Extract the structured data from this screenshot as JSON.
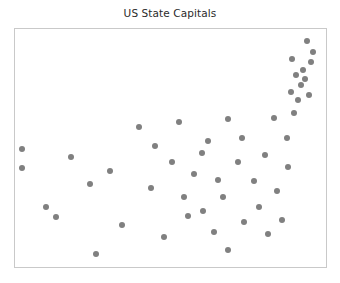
{
  "figure": {
    "title": "US State Capitals",
    "background_color": "#ffffff",
    "border_color": "#c9c9c9",
    "title_color": "#2b2b2b"
  },
  "chart_data": {
    "type": "scatter",
    "title": "US State Capitals",
    "xlabel": "",
    "ylabel": "",
    "xlim": [
      0,
      1
    ],
    "ylim": [
      0,
      1
    ],
    "grid": false,
    "legend": null,
    "marker": {
      "shape": "circle",
      "color": "#808080",
      "size_px": 6
    },
    "series": [
      {
        "name": "US State Capitals",
        "color": "#808080",
        "points": [
          {
            "x": 0.022,
            "y": 0.494
          },
          {
            "x": 0.022,
            "y": 0.415
          },
          {
            "x": 0.099,
            "y": 0.252
          },
          {
            "x": 0.131,
            "y": 0.21
          },
          {
            "x": 0.179,
            "y": 0.461
          },
          {
            "x": 0.24,
            "y": 0.348
          },
          {
            "x": 0.262,
            "y": 0.056
          },
          {
            "x": 0.307,
            "y": 0.405
          },
          {
            "x": 0.345,
            "y": 0.178
          },
          {
            "x": 0.399,
            "y": 0.588
          },
          {
            "x": 0.438,
            "y": 0.334
          },
          {
            "x": 0.45,
            "y": 0.507
          },
          {
            "x": 0.479,
            "y": 0.127
          },
          {
            "x": 0.505,
            "y": 0.443
          },
          {
            "x": 0.527,
            "y": 0.61
          },
          {
            "x": 0.543,
            "y": 0.295
          },
          {
            "x": 0.556,
            "y": 0.215
          },
          {
            "x": 0.575,
            "y": 0.392
          },
          {
            "x": 0.601,
            "y": 0.48
          },
          {
            "x": 0.604,
            "y": 0.237
          },
          {
            "x": 0.62,
            "y": 0.528
          },
          {
            "x": 0.639,
            "y": 0.145
          },
          {
            "x": 0.652,
            "y": 0.366
          },
          {
            "x": 0.668,
            "y": 0.293
          },
          {
            "x": 0.684,
            "y": 0.623
          },
          {
            "x": 0.684,
            "y": 0.073
          },
          {
            "x": 0.716,
            "y": 0.443
          },
          {
            "x": 0.729,
            "y": 0.543
          },
          {
            "x": 0.735,
            "y": 0.191
          },
          {
            "x": 0.767,
            "y": 0.362
          },
          {
            "x": 0.786,
            "y": 0.252
          },
          {
            "x": 0.805,
            "y": 0.47
          },
          {
            "x": 0.812,
            "y": 0.14
          },
          {
            "x": 0.834,
            "y": 0.625
          },
          {
            "x": 0.841,
            "y": 0.321
          },
          {
            "x": 0.86,
            "y": 0.196
          },
          {
            "x": 0.873,
            "y": 0.54
          },
          {
            "x": 0.879,
            "y": 0.42
          },
          {
            "x": 0.886,
            "y": 0.737
          },
          {
            "x": 0.892,
            "y": 0.873
          },
          {
            "x": 0.898,
            "y": 0.648
          },
          {
            "x": 0.905,
            "y": 0.808
          },
          {
            "x": 0.911,
            "y": 0.7
          },
          {
            "x": 0.92,
            "y": 0.763
          },
          {
            "x": 0.927,
            "y": 0.829
          },
          {
            "x": 0.933,
            "y": 0.789
          },
          {
            "x": 0.939,
            "y": 0.95
          },
          {
            "x": 0.946,
            "y": 0.724
          },
          {
            "x": 0.952,
            "y": 0.862
          },
          {
            "x": 0.959,
            "y": 0.905
          }
        ]
      }
    ]
  }
}
